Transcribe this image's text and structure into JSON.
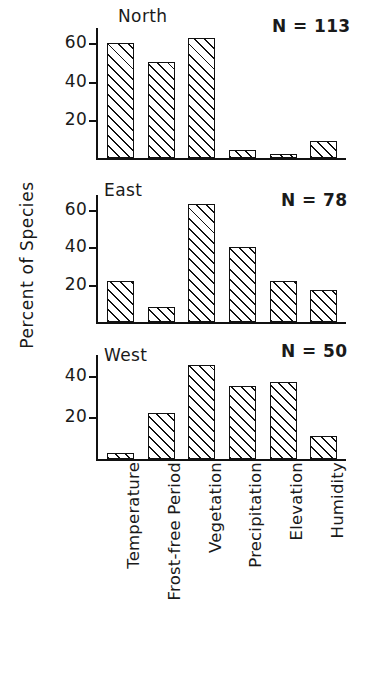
{
  "figure": {
    "ylabel": "Percent of Species"
  },
  "chart_data": {
    "type": "bar",
    "title": "",
    "xlabel": "",
    "ylabel": "Percent of Species",
    "categories": [
      "Temperature",
      "Frost-free Period",
      "Vegetation",
      "Precipitation",
      "Elevation",
      "Humidity"
    ],
    "grid": false,
    "legend": "none",
    "panels": [
      {
        "name": "North",
        "title": "North",
        "sample_size_label": "N = 113",
        "sample_size": 113,
        "ylim": [
          0,
          68
        ],
        "yticks": [
          20,
          40,
          60
        ],
        "values": [
          60,
          50,
          63,
          4,
          2,
          9
        ]
      },
      {
        "name": "East",
        "title": "East",
        "sample_size_label": "N = 78",
        "sample_size": 78,
        "ylim": [
          0,
          68
        ],
        "yticks": [
          20,
          40,
          60
        ],
        "values": [
          22,
          8,
          63,
          40,
          22,
          17
        ]
      },
      {
        "name": "West",
        "title": "West",
        "sample_size_label": "N = 50",
        "sample_size": 50,
        "ylim": [
          0,
          50
        ],
        "yticks": [
          20,
          40
        ],
        "values": [
          3,
          22,
          45,
          35,
          37,
          11
        ]
      }
    ]
  }
}
